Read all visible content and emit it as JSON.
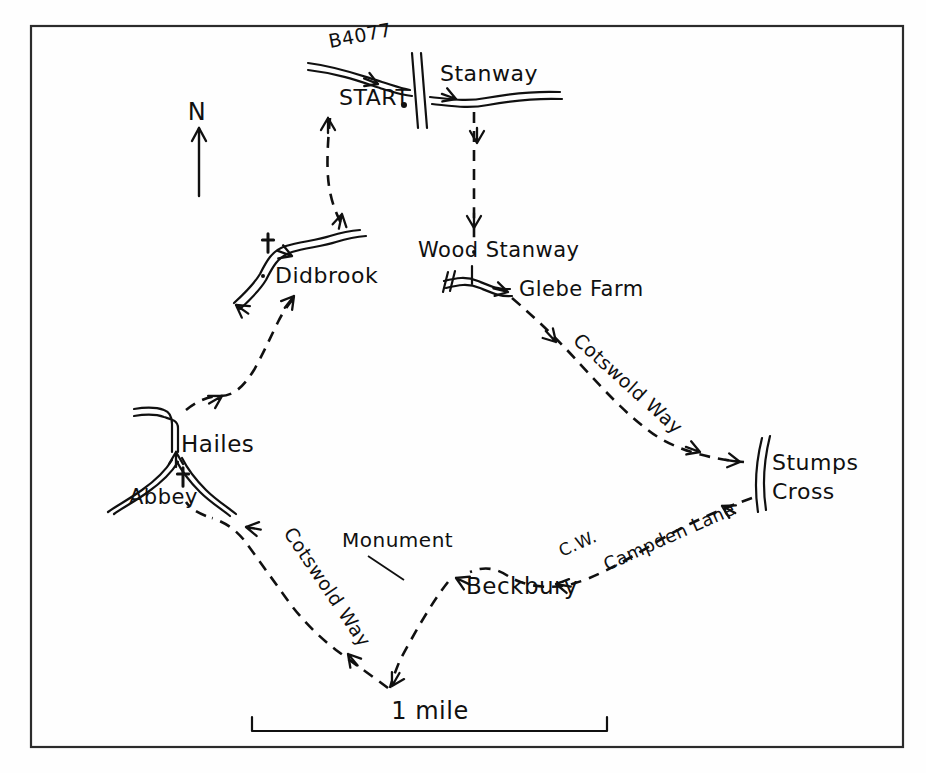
{
  "map": {
    "title": "Stanway to Stumps Cross circular walk",
    "style": "hand-drawn sketch map",
    "ink_color": "#101010",
    "paper_color": "#fefefe",
    "border": {
      "x": 31,
      "y": 26,
      "width": 872,
      "height": 721
    },
    "north_arrow": {
      "label": "N",
      "label_x": 197,
      "label_y": 120,
      "shaft_x": 199,
      "shaft_top": 128,
      "shaft_bottom": 196
    },
    "scale_bar": {
      "label": "1 mile",
      "label_x": 430,
      "label_y": 719,
      "left_x": 252,
      "right_x": 607,
      "baseline_y": 731,
      "tick_height": 14
    },
    "places": [
      {
        "id": "start",
        "label": "START",
        "x": 339,
        "y": 105,
        "size": 22,
        "rotate": 0
      },
      {
        "id": "b4077",
        "label": "B4077",
        "x": 330,
        "y": 48,
        "size": 19,
        "rotate": -11
      },
      {
        "id": "stanway",
        "label": "Stanway",
        "x": 440,
        "y": 81,
        "size": 22,
        "rotate": 0
      },
      {
        "id": "didbrook",
        "label": "Didbrook",
        "x": 275,
        "y": 283,
        "size": 22,
        "rotate": 0
      },
      {
        "id": "wood-stanway",
        "label": "Wood Stanway",
        "x": 418,
        "y": 257,
        "size": 21,
        "rotate": 0
      },
      {
        "id": "glebe-farm",
        "label": "Glebe Farm",
        "x": 519,
        "y": 296,
        "size": 21,
        "rotate": 0
      },
      {
        "id": "cotswold-way-east",
        "label": "Cotswold Way",
        "x": 572,
        "y": 342,
        "size": 19,
        "rotate": 42
      },
      {
        "id": "stumps-cross-1",
        "label": "Stumps",
        "x": 772,
        "y": 470,
        "size": 22,
        "rotate": 0
      },
      {
        "id": "stumps-cross-2",
        "label": "Cross",
        "x": 772,
        "y": 499,
        "size": 22,
        "rotate": 0
      },
      {
        "id": "campden-lane",
        "label": "Campden Lane",
        "x": 607,
        "y": 571,
        "size": 18,
        "rotate": -24
      },
      {
        "id": "cw-abbrev",
        "label": "C.W.",
        "x": 562,
        "y": 557,
        "size": 17,
        "rotate": -24
      },
      {
        "id": "beckbury",
        "label": "Beckbury",
        "x": 466,
        "y": 594,
        "size": 23,
        "rotate": 0
      },
      {
        "id": "monument",
        "label": "Monument",
        "x": 342,
        "y": 547,
        "size": 20,
        "rotate": 0
      },
      {
        "id": "cotswold-way-west",
        "label": "Cotswold Way",
        "x": 283,
        "y": 533,
        "size": 19,
        "rotate": 56
      },
      {
        "id": "hailes",
        "label": "Hailes",
        "x": 181,
        "y": 452,
        "size": 23,
        "rotate": 0
      },
      {
        "id": "abbey",
        "label": "Abbey",
        "x": 129,
        "y": 504,
        "size": 21,
        "rotate": 0
      }
    ],
    "church_symbols": [
      {
        "id": "didbrook-church",
        "x": 268,
        "y": 243,
        "size": 17
      },
      {
        "id": "hailes-church",
        "x": 183,
        "y": 477,
        "size": 17
      }
    ],
    "start_dot": {
      "x": 404,
      "y": 105,
      "r": 3
    },
    "place_dots": [
      {
        "id": "didbrook-dot",
        "x": 263,
        "y": 276,
        "r": 2
      },
      {
        "id": "wood-stanway-dot",
        "x": 474,
        "y": 252,
        "r": 2
      }
    ],
    "roads": [
      {
        "id": "road-b4077-stanway",
        "d": "M 308 63 C 340 67 362 76 382 82 C 392 85 400 88 410 90 M 308 70 C 342 74 364 83 383 89 C 393 92 401 95 412 96"
      },
      {
        "id": "road-stanway-east",
        "d": "M 430 97 C 450 99 466 102 486 98 C 508 94 536 91 560 92 M 432 104 C 452 106 468 109 488 105 C 510 101 538 98 562 99"
      },
      {
        "id": "road-stanway-crossbar",
        "d": "M 412 53 L 418 128 M 421 53 L 427 128"
      },
      {
        "id": "road-didbrook",
        "d": "M 234 303 C 246 292 254 284 260 274 C 266 262 272 250 286 246 C 300 242 318 240 330 236 C 340 233 348 231 360 230 M 240 309 C 252 298 260 290 266 280 C 272 268 278 256 292 252 C 306 248 324 246 336 242 C 346 239 354 237 366 236"
      },
      {
        "id": "road-wood-stanway",
        "d": "M 444 281 C 456 278 466 276 478 281 C 490 286 498 290 510 289 M 446 288 C 458 285 468 283 480 288 C 492 293 500 297 512 296"
      },
      {
        "id": "road-wood-stanway-tick-a",
        "d": "M 448 272 L 443 292 M 455 271 L 450 291"
      },
      {
        "id": "road-wood-stanway-tick-b",
        "d": "M 472 266 L 472 284"
      },
      {
        "id": "road-hailes-north",
        "d": "M 134 409 C 146 407 156 407 164 410 C 170 412 172 417 172 424 L 172 452 M 134 416 C 146 414 156 414 164 417 C 170 419 178 420 178 428 L 178 452"
      },
      {
        "id": "road-hailes-south-left",
        "d": "M 172 460 C 166 470 156 480 142 490 C 128 500 116 506 108 512 M 178 462 C 172 472 162 482 148 492 C 134 502 122 508 114 514"
      },
      {
        "id": "road-hailes-south-right",
        "d": "M 176 460 C 182 472 190 482 200 492 C 210 502 220 508 230 516 M 182 458 C 188 470 196 480 206 490 C 216 500 226 506 236 514"
      },
      {
        "id": "road-stumps-cross",
        "d": "M 762 438 C 756 462 754 486 758 512 M 770 436 C 764 460 762 484 766 510"
      }
    ],
    "road_arrows": [
      {
        "id": "arrow-road-b4077",
        "x": 378,
        "y": 84,
        "angle": 22
      },
      {
        "id": "arrow-road-stanway-east",
        "x": 456,
        "y": 99,
        "angle": 20
      },
      {
        "id": "arrow-road-didbrook-1",
        "x": 292,
        "y": 256,
        "angle": 20
      },
      {
        "id": "arrow-road-didbrook-2",
        "x": 236,
        "y": 305,
        "angle": 215
      },
      {
        "id": "arrow-road-glebe",
        "x": 508,
        "y": 292,
        "angle": 14
      },
      {
        "id": "arrow-road-hailes",
        "x": 176,
        "y": 452,
        "angle": -90
      }
    ],
    "trail": {
      "id": "walk-route",
      "description": "dashed circular footpath route",
      "segments": [
        {
          "id": "seg-start-didbrook",
          "d": "M 330 118 C 328 140 326 166 329 186 C 332 206 338 216 342 226"
        },
        {
          "id": "seg-stanway-woodstanway",
          "d": "M 474 112 C 474 140 474 170 474 196 C 474 216 474 232 474 244"
        },
        {
          "id": "seg-glebe-stumps",
          "d": "M 512 298 C 540 322 562 344 580 364 C 604 390 624 412 648 430 C 668 446 700 458 744 462"
        },
        {
          "id": "seg-stumps-beckbury",
          "d": "M 752 498 C 718 510 682 526 650 546 C 620 564 594 578 572 584 C 548 590 524 586 508 576 C 496 568 484 566 470 572"
        },
        {
          "id": "seg-beckbury-apex",
          "d": "M 448 582 C 432 602 414 634 400 660 C 396 670 392 680 390 688"
        },
        {
          "id": "seg-apex-cotswold-west",
          "d": "M 388 688 C 372 676 352 662 336 650 C 318 636 300 618 286 598 C 270 576 256 556 244 540 C 234 528 224 522 212 518"
        },
        {
          "id": "seg-abbey-hailes",
          "d": "M 206 516 C 196 512 190 508 186 502"
        },
        {
          "id": "seg-hailes-didbrook",
          "d": "M 186 410 C 196 402 208 396 220 396 C 234 396 244 386 254 370 C 264 352 272 334 278 322 C 284 310 290 302 296 296"
        }
      ],
      "arrows": [
        {
          "id": "trail-arrow-start-north",
          "x": 328,
          "y": 118,
          "angle": -90
        },
        {
          "id": "trail-arrow-didbrook-up",
          "x": 342,
          "y": 214,
          "angle": -78
        },
        {
          "id": "trail-arrow-stanway-down-1",
          "x": 477,
          "y": 143,
          "angle": 90
        },
        {
          "id": "trail-arrow-stanway-down-2",
          "x": 474,
          "y": 228,
          "angle": 90
        },
        {
          "id": "trail-arrow-cotswold-east-1",
          "x": 556,
          "y": 342,
          "angle": 47
        },
        {
          "id": "trail-arrow-cotswold-east-2",
          "x": 700,
          "y": 452,
          "angle": 20
        },
        {
          "id": "trail-arrow-stumps-in",
          "x": 740,
          "y": 462,
          "angle": 8
        },
        {
          "id": "trail-arrow-campden-1",
          "x": 722,
          "y": 506,
          "angle": 208
        },
        {
          "id": "trail-arrow-campden-2",
          "x": 556,
          "y": 584,
          "angle": 190
        },
        {
          "id": "trail-arrow-beckbury-in",
          "x": 456,
          "y": 578,
          "angle": 205
        },
        {
          "id": "trail-arrow-apex-left",
          "x": 392,
          "y": 686,
          "angle": 120
        },
        {
          "id": "trail-arrow-cotswold-west",
          "x": 348,
          "y": 654,
          "angle": 230
        },
        {
          "id": "trail-arrow-abbey",
          "x": 246,
          "y": 527,
          "angle": 190
        },
        {
          "id": "trail-arrow-hailes-up",
          "x": 222,
          "y": 396,
          "angle": -30
        },
        {
          "id": "trail-arrow-didbrook-in",
          "x": 294,
          "y": 296,
          "angle": -52
        }
      ]
    },
    "leader_lines": [
      {
        "id": "monument-leader",
        "d": "M 368 556 L 404 580"
      }
    ]
  }
}
